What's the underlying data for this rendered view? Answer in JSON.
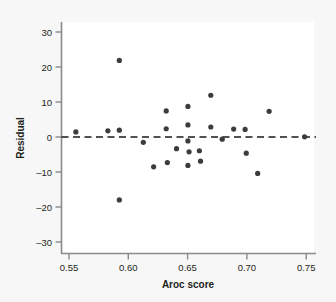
{
  "chart_data": {
    "type": "scatter",
    "title": "",
    "xlabel": "Aroc score",
    "ylabel": "Residual",
    "xlim": [
      0.539,
      0.762
    ],
    "ylim": [
      -33.5,
      33.0
    ],
    "xticks": [
      0.55,
      0.6,
      0.65,
      0.7,
      0.75
    ],
    "xtick_labels": [
      "0.55",
      "0.60",
      "0.65",
      "0.70",
      "0.75"
    ],
    "yticks": [
      -30,
      -20,
      -10,
      0,
      10,
      20,
      30
    ],
    "ytick_labels": [
      "–30",
      "–20",
      "–10",
      "0",
      "10",
      "20",
      "30"
    ],
    "grid": false,
    "legend": null,
    "reference_line": {
      "name": "zero-residual-line",
      "orientation": "horizontal",
      "y": 0,
      "style": "dashed",
      "color": "#1a1a1a"
    },
    "marker": {
      "shape": "circle",
      "color": "#3c3c3c",
      "size_px": 4
    },
    "points": [
      {
        "x": 0.552,
        "y": 1.5
      },
      {
        "x": 0.58,
        "y": 1.8
      },
      {
        "x": 0.59,
        "y": 22.0
      },
      {
        "x": 0.59,
        "y": 2.0
      },
      {
        "x": 0.59,
        "y": -18.0
      },
      {
        "x": 0.611,
        "y": -1.5
      },
      {
        "x": 0.62,
        "y": -8.5
      },
      {
        "x": 0.631,
        "y": 7.5
      },
      {
        "x": 0.631,
        "y": 2.4
      },
      {
        "x": 0.632,
        "y": -7.3
      },
      {
        "x": 0.64,
        "y": -3.3
      },
      {
        "x": 0.65,
        "y": 8.8
      },
      {
        "x": 0.65,
        "y": 3.5
      },
      {
        "x": 0.65,
        "y": -1.1
      },
      {
        "x": 0.651,
        "y": -4.2
      },
      {
        "x": 0.65,
        "y": -8.1
      },
      {
        "x": 0.66,
        "y": -3.9
      },
      {
        "x": 0.661,
        "y": -6.9
      },
      {
        "x": 0.67,
        "y": 12.0
      },
      {
        "x": 0.67,
        "y": 2.9
      },
      {
        "x": 0.68,
        "y": -0.6
      },
      {
        "x": 0.69,
        "y": 2.3
      },
      {
        "x": 0.7,
        "y": 2.2
      },
      {
        "x": 0.701,
        "y": -4.6
      },
      {
        "x": 0.711,
        "y": -10.4
      },
      {
        "x": 0.721,
        "y": 7.4
      },
      {
        "x": 0.752,
        "y": 0.1
      }
    ]
  },
  "figure": {
    "background_color": "#f7f7f7",
    "plot_background_color": "#ffffff",
    "axis_color": "#808080",
    "text_color": "#231f20"
  }
}
